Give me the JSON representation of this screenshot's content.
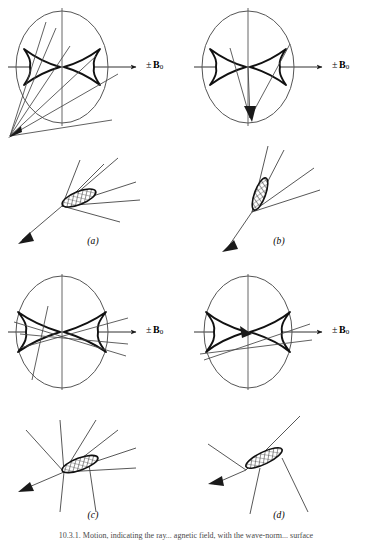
{
  "figure": {
    "axis_label_pm": "±",
    "axis_label_symbol": "B",
    "axis_label_subscript": "0",
    "caption": "10.3.1. Motion, indicating the ray... agnetic field, with the wave-norm... surface",
    "stroke_color": "#1a1a1a",
    "thin_stroke_color": "#555555",
    "background": "#ffffff"
  },
  "panels": [
    {
      "id": "a",
      "label": "(a)",
      "axis_label_visible": true,
      "upper": {
        "ellipse_rx": 46,
        "ellipse_ry": 56,
        "cusp_half_width": 36,
        "cusp_half_height": 18,
        "arrow_tip_x": 140,
        "ray_fan_origin_x": 8,
        "ray_fan_origin_y": 138,
        "ray_count": 6
      },
      "lower": {
        "vertex_x": 62,
        "vertex_y": 206,
        "ellipse_cx": 78,
        "ellipse_cy": 198,
        "ellipse_rx": 18,
        "ellipse_ry": 6.5,
        "ellipse_rotation_deg": -22,
        "ray_count": 7,
        "arrow_dir_deg": 206
      }
    },
    {
      "id": "b",
      "label": "(b)",
      "axis_label_visible": true,
      "upper": {
        "ellipse_rx": 46,
        "ellipse_ry": 56,
        "cusp_half_width": 36,
        "cusp_half_height": 18,
        "arrow_tip_x": 140,
        "ray_fan_origin_x": 60,
        "ray_fan_origin_y": 118,
        "ray_count": 3
      },
      "lower": {
        "vertex_x": 66,
        "vertex_y": 212,
        "ellipse_cx": 72,
        "ellipse_cy": 198,
        "ellipse_rx": 16,
        "ellipse_ry": 5.5,
        "ellipse_rotation_deg": -68,
        "ray_count": 5,
        "arrow_dir_deg": 214
      }
    },
    {
      "id": "c",
      "label": "(c)",
      "axis_label_visible": true,
      "upper": {
        "ellipse_rx": 46,
        "ellipse_ry": 56,
        "cusp_half_width": 40,
        "cusp_half_height": 17,
        "arrow_tip_x": 140,
        "ray_fan_origin_x": 82,
        "ray_fan_origin_y": 88,
        "ray_count": 4
      },
      "lower": {
        "vertex_x": 64,
        "vertex_y": 210,
        "ellipse_cx": 80,
        "ellipse_cy": 202,
        "ellipse_rx": 19,
        "ellipse_ry": 6,
        "ellipse_rotation_deg": -20,
        "ray_count": 7,
        "arrow_dir_deg": 200
      }
    },
    {
      "id": "d",
      "label": "(d)",
      "axis_label_visible": true,
      "upper": {
        "ellipse_rx": 44,
        "ellipse_ry": 56,
        "cusp_half_width": 38,
        "cusp_half_height": 16,
        "arrow_tip_x": 140,
        "ray_fan_origin_x": 68,
        "ray_fan_origin_y": 92,
        "ray_count": 3
      },
      "lower": {
        "vertex_x": 60,
        "vertex_y": 208,
        "ellipse_cx": 78,
        "ellipse_cy": 196,
        "ellipse_rx": 20,
        "ellipse_ry": 6,
        "ellipse_rotation_deg": -26,
        "ray_count": 6,
        "arrow_dir_deg": 202
      }
    }
  ]
}
